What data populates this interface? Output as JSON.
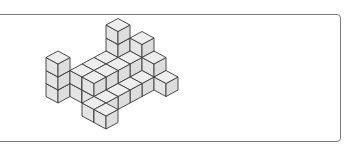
{
  "figure": {
    "type": "isometric-cube-structure",
    "cube_colors": {
      "top": "#eeeeee",
      "left": "#e4e4e4",
      "right": "#dddddd",
      "edge": "#3a3a3a"
    },
    "frame_color": "#7a7a7a",
    "cubes": [
      {
        "i": 0,
        "j": 0,
        "k": 0
      },
      {
        "i": 0,
        "j": 0,
        "k": 1
      },
      {
        "i": 0,
        "j": 0,
        "k": 2
      },
      {
        "i": 1,
        "j": -1,
        "k": 0
      },
      {
        "i": 1,
        "j": -1,
        "k": 1
      },
      {
        "i": 1,
        "j": -2,
        "k": 0
      },
      {
        "i": 1,
        "j": -2,
        "k": 1
      },
      {
        "i": 1,
        "j": -3,
        "k": 0
      },
      {
        "i": 1,
        "j": -3,
        "k": 1
      },
      {
        "i": 1,
        "j": -4,
        "k": 0
      },
      {
        "i": 1,
        "j": -4,
        "k": 1
      },
      {
        "i": 1,
        "j": -4,
        "k": 2
      },
      {
        "i": 1,
        "j": -4,
        "k": 3
      },
      {
        "i": 2,
        "j": -5,
        "k": 0
      },
      {
        "i": 2,
        "j": -5,
        "k": 1
      },
      {
        "i": 2,
        "j": -5,
        "k": 2
      },
      {
        "i": 2,
        "j": -1,
        "k": 0
      },
      {
        "i": 2,
        "j": -1,
        "k": 1
      },
      {
        "i": 2,
        "j": -2,
        "k": 0
      },
      {
        "i": 2,
        "j": -2,
        "k": 1
      },
      {
        "i": 2,
        "j": -3,
        "k": 0
      },
      {
        "i": 2,
        "j": -3,
        "k": 1
      },
      {
        "i": 2,
        "j": -4,
        "k": 0
      },
      {
        "i": 2,
        "j": -4,
        "k": 1
      },
      {
        "i": 3,
        "j": -1,
        "k": 0
      },
      {
        "i": 3,
        "j": -2,
        "k": 0
      },
      {
        "i": 3,
        "j": -3,
        "k": 0
      },
      {
        "i": 3,
        "j": -4,
        "k": 0
      },
      {
        "i": 3,
        "j": -5,
        "k": 0
      },
      {
        "i": 3,
        "j": -5,
        "k": 1
      },
      {
        "i": 4,
        "j": -5,
        "k": 0
      },
      {
        "i": 3,
        "j": 0,
        "k": 0
      },
      {
        "i": 4,
        "j": 0,
        "k": 0
      }
    ]
  }
}
